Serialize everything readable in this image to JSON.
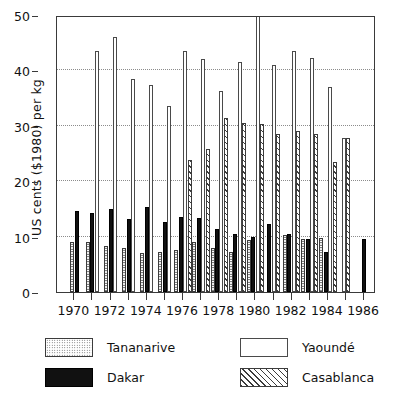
{
  "axes": {
    "ylabel": "US cents ($1980) per kg",
    "yticks": [
      0,
      10,
      20,
      30,
      40,
      50
    ],
    "xticklabels": [
      "1970",
      "1972",
      "1974",
      "1976",
      "1978",
      "1980",
      "1982",
      "1984",
      "1986"
    ]
  },
  "legend": [
    {
      "label": "Tananarive",
      "pattern": "stipple-swatch"
    },
    {
      "label": "Yaoundé",
      "pattern": "white-swatch"
    },
    {
      "label": "Dakar",
      "pattern": "solid-black-swatch"
    },
    {
      "label": "Casablanca",
      "pattern": "diagonal-hatch-swatch"
    }
  ],
  "colors": {
    "axis": "#3a3a3a",
    "grid": "#8c8c8c",
    "dakar": "#111111",
    "outline": "#3c3c3c",
    "background": "#ffffff"
  },
  "chart_data": {
    "type": "bar",
    "title": "",
    "xlabel": "",
    "ylabel": "US cents ($1980) per kg",
    "ylim": [
      0,
      50
    ],
    "grid": true,
    "grid_values": [
      10,
      20,
      30,
      40
    ],
    "legend_position": "below",
    "categories": [
      "1970",
      "1971",
      "1972",
      "1973",
      "1974",
      "1975",
      "1976",
      "1977",
      "1978",
      "1979",
      "1980",
      "1981",
      "1982",
      "1983",
      "1984",
      "1985",
      "1986"
    ],
    "series": [
      {
        "name": "Tananarive",
        "values": [
          9.0,
          9.0,
          8.3,
          8.0,
          7.0,
          7.2,
          7.5,
          9.0,
          8.0,
          7.3,
          9.3,
          null,
          10.3,
          9.6,
          9.8,
          null,
          null
        ]
      },
      {
        "name": "Dakar",
        "values": [
          14.7,
          14.3,
          15.0,
          13.2,
          15.3,
          12.7,
          13.5,
          13.3,
          11.3,
          10.5,
          10.0,
          12.3,
          10.5,
          9.6,
          7.2,
          null,
          9.5
        ]
      },
      {
        "name": "Yaoundé",
        "values": [
          null,
          43.5,
          46.0,
          38.5,
          37.3,
          33.5,
          43.5,
          42.0,
          36.3,
          41.5,
          52.0,
          41.0,
          43.5,
          42.3,
          37.0,
          27.8,
          null
        ]
      },
      {
        "name": "Casablanca",
        "values": [
          null,
          null,
          null,
          null,
          null,
          null,
          23.8,
          25.8,
          31.5,
          30.5,
          30.3,
          28.5,
          29.0,
          28.5,
          23.5,
          27.8,
          null
        ]
      }
    ]
  }
}
